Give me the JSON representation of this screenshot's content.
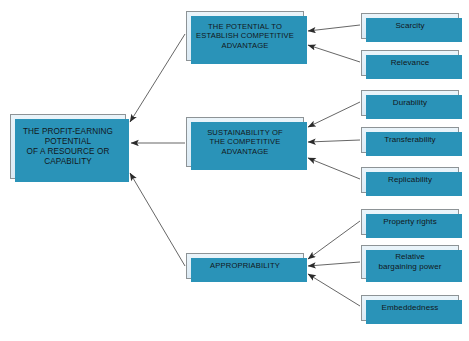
{
  "diagram": {
    "title": "The Profit-Earning Potential of a Resource or Capability",
    "flow_direction": "right-to-left",
    "colors": {
      "box_fill": "#e6f1f8",
      "box_border": "#8d9396",
      "box_shadow": "#2a93b8",
      "arrow": "#3b3b3b",
      "background": "#ffffff",
      "text": "#12171a"
    },
    "root": {
      "id": "root",
      "label": "THE PROFIT-EARNING\nPOTENTIAL\nOF A RESOURCE OR\nCAPABILITY"
    },
    "mid_nodes": [
      {
        "id": "potential",
        "label": "THE POTENTIAL TO\nESTABLISH  COMPETITIVE\nADVANTAGE"
      },
      {
        "id": "sustainability",
        "label": "SUSTAINABILITY OF\nTHE COMPETITIVE\nADVANTAGE"
      },
      {
        "id": "appropriability",
        "label": "APPROPRIABILITY"
      }
    ],
    "leaf_nodes": [
      {
        "id": "scarcity",
        "label": "Scarcity",
        "parent": "potential"
      },
      {
        "id": "relevance",
        "label": "Relevance",
        "parent": "potential"
      },
      {
        "id": "durability",
        "label": "Durability",
        "parent": "sustainability"
      },
      {
        "id": "transferability",
        "label": "Transferability",
        "parent": "sustainability"
      },
      {
        "id": "replicability",
        "label": "Replicability",
        "parent": "sustainability"
      },
      {
        "id": "property",
        "label": "Property rights",
        "parent": "appropriability"
      },
      {
        "id": "bargaining",
        "label": "Relative\nbargaining power",
        "parent": "appropriability"
      },
      {
        "id": "embeddedness",
        "label": "Embeddedness",
        "parent": "appropriability"
      }
    ]
  }
}
